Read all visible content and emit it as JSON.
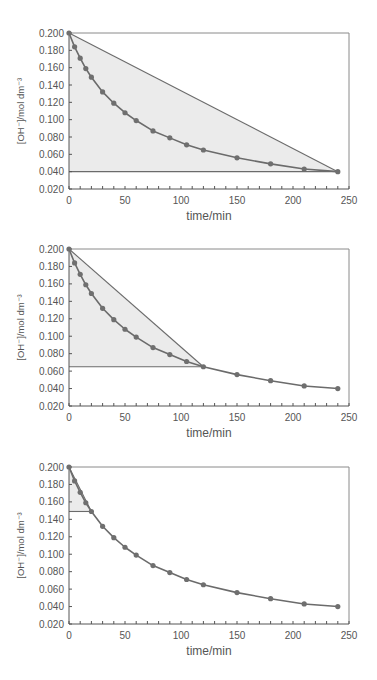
{
  "chart_data": [
    {
      "type": "line",
      "title": "",
      "xlabel": "time/min",
      "ylabel": "[OH⁻]/mol dm⁻³",
      "xlim": [
        0,
        250
      ],
      "ylim": [
        0.02,
        0.2
      ],
      "x_ticks": [
        "0",
        "50",
        "100",
        "150",
        "200",
        "250"
      ],
      "y_ticks": [
        "0.200",
        "0.180",
        "0.160",
        "0.140",
        "0.120",
        "0.100",
        "0.080",
        "0.060",
        "0.040",
        "0.020"
      ],
      "grid": false,
      "legend": null,
      "x": [
        0,
        5,
        10,
        15,
        20,
        30,
        40,
        50,
        60,
        75,
        90,
        105,
        120,
        150,
        180,
        210,
        240
      ],
      "series": [
        {
          "name": "[OH-]",
          "values": [
            0.2,
            0.184,
            0.171,
            0.159,
            0.149,
            0.132,
            0.119,
            0.108,
            0.099,
            0.087,
            0.079,
            0.071,
            0.065,
            0.056,
            0.049,
            0.043,
            0.04
          ]
        }
      ],
      "annotations": [
        {
          "type": "shaded-triangle",
          "from": [
            0,
            0.2
          ],
          "to": [
            240,
            0.04
          ],
          "note": "secant from t=0 to t=240"
        }
      ]
    },
    {
      "type": "line",
      "title": "",
      "xlabel": "time/min",
      "ylabel": "[OH⁻]/mol dm⁻³",
      "xlim": [
        0,
        250
      ],
      "ylim": [
        0.02,
        0.2
      ],
      "x_ticks": [
        "0",
        "50",
        "100",
        "150",
        "200",
        "250"
      ],
      "y_ticks": [
        "0.200",
        "0.180",
        "0.160",
        "0.140",
        "0.120",
        "0.100",
        "0.080",
        "0.060",
        "0.040",
        "0.020"
      ],
      "grid": false,
      "legend": null,
      "x": [
        0,
        5,
        10,
        15,
        20,
        30,
        40,
        50,
        60,
        75,
        90,
        105,
        120,
        150,
        180,
        210,
        240
      ],
      "series": [
        {
          "name": "[OH-]",
          "values": [
            0.2,
            0.184,
            0.171,
            0.159,
            0.149,
            0.132,
            0.119,
            0.108,
            0.099,
            0.087,
            0.079,
            0.071,
            0.065,
            0.056,
            0.049,
            0.043,
            0.04
          ]
        }
      ],
      "annotations": [
        {
          "type": "shaded-triangle",
          "from": [
            0,
            0.2
          ],
          "to": [
            120,
            0.065
          ],
          "note": "secant from t=0 to t=120"
        }
      ]
    },
    {
      "type": "line",
      "title": "",
      "xlabel": "time/min",
      "ylabel": "[OH⁻]/mol dm⁻³",
      "xlim": [
        0,
        250
      ],
      "ylim": [
        0.02,
        0.2
      ],
      "x_ticks": [
        "0",
        "50",
        "100",
        "150",
        "200",
        "250"
      ],
      "y_ticks": [
        "0.200",
        "0.180",
        "0.160",
        "0.140",
        "0.120",
        "0.100",
        "0.080",
        "0.060",
        "0.040",
        "0.020"
      ],
      "grid": false,
      "legend": null,
      "x": [
        0,
        5,
        10,
        15,
        20,
        30,
        40,
        50,
        60,
        75,
        90,
        105,
        120,
        150,
        180,
        210,
        240
      ],
      "series": [
        {
          "name": "[OH-]",
          "values": [
            0.2,
            0.184,
            0.171,
            0.159,
            0.149,
            0.132,
            0.119,
            0.108,
            0.099,
            0.087,
            0.079,
            0.071,
            0.065,
            0.056,
            0.049,
            0.043,
            0.04
          ]
        }
      ],
      "annotations": [
        {
          "type": "shaded-triangle",
          "from": [
            0,
            0.2
          ],
          "to": [
            20,
            0.149
          ],
          "note": "secant from t=0 to t=20"
        }
      ]
    }
  ],
  "colors": {
    "line": "#6b6b6b",
    "marker": "#6f6f6f",
    "shade": "#ebebeb",
    "axis": "#555555",
    "frame": "#8a8a8a",
    "text": "#555555"
  }
}
